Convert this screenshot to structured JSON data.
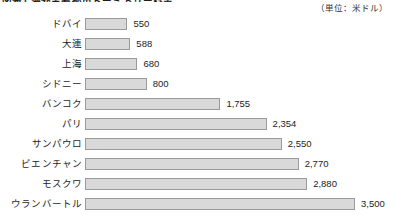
{
  "figure": {
    "title": "図表1 海外主要都市ドーミトリー料金",
    "unit_note": "（単位：米ドル）"
  },
  "chart_data": {
    "type": "bar",
    "orientation": "horizontal",
    "title": "図表1 海外主要都市ドーミトリー料金",
    "xlabel": "",
    "ylabel": "",
    "unit": "米ドル",
    "grid": false,
    "legend": "none",
    "xlim": [
      0,
      3500
    ],
    "categories": [
      "ドバイ",
      "大連",
      "上海",
      "シドニー",
      "バンコク",
      "パリ",
      "サンパウロ",
      "ビエンチャン",
      "モスクワ",
      "ウランバートル"
    ],
    "values": [
      550,
      588,
      680,
      800,
      1755,
      2354,
      2550,
      2770,
      2880,
      3500
    ],
    "value_labels": [
      "550",
      "588",
      "680",
      "800",
      "1,755",
      "2,354",
      "2,550",
      "2,770",
      "2,880",
      "3,500"
    ],
    "bar_color": "#d9d9d9",
    "bar_border_color": "#9a9a9a"
  }
}
